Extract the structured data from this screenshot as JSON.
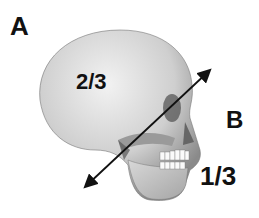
{
  "figure": {
    "labels": {
      "a": "A",
      "b": "B",
      "upper_ratio": "2/3",
      "lower_ratio": "1/3"
    },
    "arrow": {
      "from": [
        83,
        189
      ],
      "to": [
        212,
        68
      ],
      "direction": "bidirectional"
    }
  }
}
